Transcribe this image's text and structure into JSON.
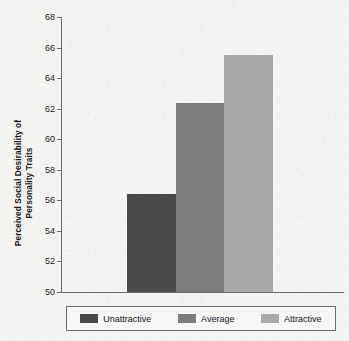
{
  "chart_data": {
    "type": "bar",
    "title": "",
    "xlabel": "",
    "ylabel": "Perceived Social Desirability of\nPersonality Traits",
    "categories": [
      "Unattractive",
      "Average",
      "Attractive"
    ],
    "values": [
      56.4,
      62.4,
      65.5
    ],
    "ylim": [
      50,
      68
    ],
    "yticks": [
      50,
      52,
      54,
      56,
      58,
      60,
      62,
      64,
      66,
      68
    ],
    "ytick_labels": [
      "50",
      "52",
      "54",
      "56",
      "58",
      "60",
      "62",
      "64",
      "66",
      "68"
    ],
    "grid": false,
    "legend_position": "bottom",
    "bar_colors": [
      "#4a4a4a",
      "#7d7d7d",
      "#a9a9a9"
    ],
    "axis_color": "#6b6b6b",
    "background_color": "#f3f3f1"
  },
  "legend": {
    "entries": [
      {
        "label": "Unattractive",
        "color": "#4a4a4a"
      },
      {
        "label": "Average",
        "color": "#7d7d7d"
      },
      {
        "label": "Attractive",
        "color": "#a9a9a9"
      }
    ]
  }
}
